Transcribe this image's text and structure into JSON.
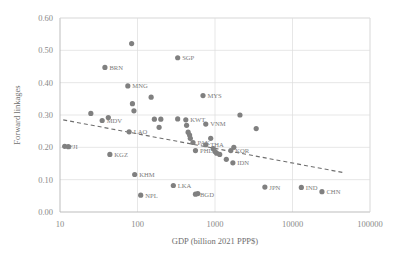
{
  "chart_data": {
    "type": "scatter",
    "title": "",
    "xlabel": "GDP (billion 2021 PPP$)",
    "ylabel": "Forward linkages",
    "xscale": "log",
    "yscale": "linear",
    "xlim": [
      10,
      100000
    ],
    "ylim": [
      0.0,
      0.6
    ],
    "xticks": [
      "10",
      "100",
      "1000",
      "10000",
      "100000"
    ],
    "xtick_values": [
      10,
      100,
      1000,
      10000,
      100000
    ],
    "yticks": [
      "0.00",
      "0.10",
      "0.20",
      "0.30",
      "0.40",
      "0.50",
      "0.60"
    ],
    "ytick_values": [
      0.0,
      0.1,
      0.2,
      0.3,
      0.4,
      0.5,
      0.6
    ],
    "grid": true,
    "legend": "none",
    "marker_color": "#808080",
    "trendline": {
      "style": "dashed",
      "color": "#6e6e6e",
      "x_start": 11,
      "y_start": 0.285,
      "x_end": 45000,
      "y_end": 0.122
    },
    "points": [
      {
        "label": "FJI",
        "x": 11.5,
        "y": 0.203
      },
      {
        "label": "",
        "x": 12.8,
        "y": 0.202
      },
      {
        "label": "",
        "x": 25,
        "y": 0.305
      },
      {
        "label": "BRN",
        "x": 38,
        "y": 0.447
      },
      {
        "label": "MDV",
        "x": 35,
        "y": 0.283
      },
      {
        "label": "",
        "x": 42,
        "y": 0.292
      },
      {
        "label": "KGZ",
        "x": 44,
        "y": 0.178
      },
      {
        "label": "MNG",
        "x": 75,
        "y": 0.39
      },
      {
        "label": "",
        "x": 84,
        "y": 0.521
      },
      {
        "label": "",
        "x": 86,
        "y": 0.335
      },
      {
        "label": "",
        "x": 90,
        "y": 0.313
      },
      {
        "label": "LAO",
        "x": 78,
        "y": 0.248
      },
      {
        "label": "KHM",
        "x": 92,
        "y": 0.116
      },
      {
        "label": "NPL",
        "x": 110,
        "y": 0.052
      },
      {
        "label": "",
        "x": 150,
        "y": 0.355
      },
      {
        "label": "",
        "x": 165,
        "y": 0.287
      },
      {
        "label": "",
        "x": 200,
        "y": 0.287
      },
      {
        "label": "",
        "x": 190,
        "y": 0.262
      },
      {
        "label": "SGP",
        "x": 330,
        "y": 0.477
      },
      {
        "label": "LKA",
        "x": 290,
        "y": 0.082
      },
      {
        "label": "",
        "x": 330,
        "y": 0.288
      },
      {
        "label": "KWT",
        "x": 420,
        "y": 0.285
      },
      {
        "label": "",
        "x": 430,
        "y": 0.268
      },
      {
        "label": "",
        "x": 450,
        "y": 0.247
      },
      {
        "label": "",
        "x": 470,
        "y": 0.238
      },
      {
        "label": "",
        "x": 480,
        "y": 0.228
      },
      {
        "label": "PAK",
        "x": 520,
        "y": 0.215
      },
      {
        "label": "PHL",
        "x": 560,
        "y": 0.19
      },
      {
        "label": "BGD",
        "x": 560,
        "y": 0.055
      },
      {
        "label": "",
        "x": 600,
        "y": 0.057
      },
      {
        "label": "MYS",
        "x": 700,
        "y": 0.36
      },
      {
        "label": "VNM",
        "x": 760,
        "y": 0.272
      },
      {
        "label": "THA",
        "x": 760,
        "y": 0.208
      },
      {
        "label": "",
        "x": 880,
        "y": 0.228
      },
      {
        "label": "",
        "x": 950,
        "y": 0.196
      },
      {
        "label": "",
        "x": 1000,
        "y": 0.187
      },
      {
        "label": "",
        "x": 1050,
        "y": 0.182
      },
      {
        "label": "",
        "x": 1150,
        "y": 0.178
      },
      {
        "label": "KOR",
        "x": 1600,
        "y": 0.19
      },
      {
        "label": "",
        "x": 1750,
        "y": 0.2
      },
      {
        "label": "",
        "x": 1400,
        "y": 0.163
      },
      {
        "label": "IDN",
        "x": 1700,
        "y": 0.152
      },
      {
        "label": "",
        "x": 2100,
        "y": 0.3
      },
      {
        "label": "",
        "x": 3400,
        "y": 0.258
      },
      {
        "label": "JPN",
        "x": 4400,
        "y": 0.077
      },
      {
        "label": "IND",
        "x": 13000,
        "y": 0.076
      },
      {
        "label": "CHN",
        "x": 24000,
        "y": 0.063
      }
    ]
  },
  "axes": {
    "xlabel": "GDP (billion 2021 PPP$)",
    "ylabel": "Forward linkages"
  }
}
